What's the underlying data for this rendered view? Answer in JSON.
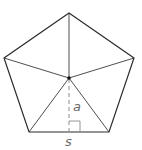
{
  "diagram": {
    "labels": {
      "apothem": "a",
      "side": "s"
    },
    "colors": {
      "outline": "#2a2a2a",
      "spokes": "#3a3a3a",
      "apothem": "#8a8a8a",
      "label": "#666666",
      "center": "#111111"
    },
    "vertices": [
      {
        "name": "top",
        "x": 69,
        "y": 13
      },
      {
        "name": "upper-right",
        "x": 134,
        "y": 58
      },
      {
        "name": "lower-right",
        "x": 109,
        "y": 132
      },
      {
        "name": "lower-left",
        "x": 29,
        "y": 132
      },
      {
        "name": "upper-left",
        "x": 4,
        "y": 58
      }
    ],
    "center": {
      "x": 69,
      "y": 78
    },
    "apothem_foot": {
      "x": 69,
      "y": 132
    }
  }
}
